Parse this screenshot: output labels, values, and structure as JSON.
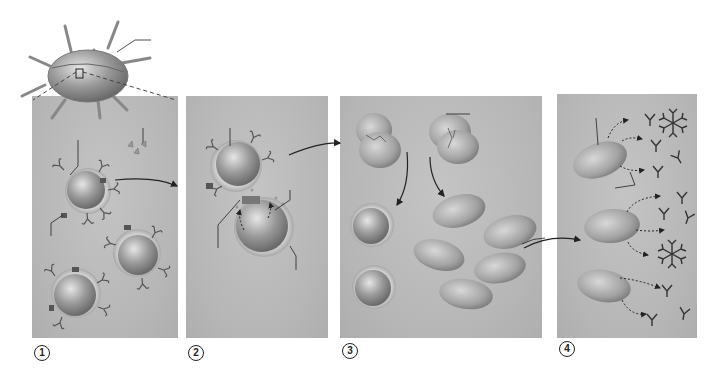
{
  "figure": {
    "colors": {
      "panel_bg": "#b9b9b9",
      "cell_fill": "#9a9a9a",
      "line": "#222222",
      "background": "#ffffff"
    }
  },
  "steps": [
    {
      "number": "1",
      "label": "Antigen-presenting cell displays antigen; B cells with receptors"
    },
    {
      "number": "2",
      "label": "Helper T cell binds and activates B cell via cytokines"
    },
    {
      "number": "3",
      "label": "B cell divides into memory cells and plasma cells"
    },
    {
      "number": "4",
      "label": "Plasma cells secrete antibodies"
    }
  ]
}
